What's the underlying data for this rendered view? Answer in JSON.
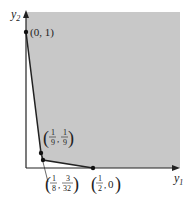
{
  "diagram": {
    "type": "feasible-region",
    "axes": {
      "x_label": "y",
      "x_sub": "1",
      "y_label": "y",
      "y_sub": "2"
    },
    "region_color": "#c8c8c8",
    "points": [
      {
        "id": "p1",
        "x": 0,
        "y": 1,
        "label": "(0, 1)"
      },
      {
        "id": "p2",
        "x": 0.1111,
        "y": 0.1111,
        "label_num_x": "1",
        "label_den_x": "9",
        "label_num_y": "1",
        "label_den_y": "9"
      },
      {
        "id": "p3",
        "x": 0.125,
        "y": 0.09375,
        "label_num_x": "1",
        "label_den_x": "8",
        "label_num_y": "3",
        "label_den_y": "32"
      },
      {
        "id": "p4",
        "x": 0.5,
        "y": 0,
        "label_num_x": "1",
        "label_den_x": "2",
        "label_y": "0"
      }
    ]
  }
}
